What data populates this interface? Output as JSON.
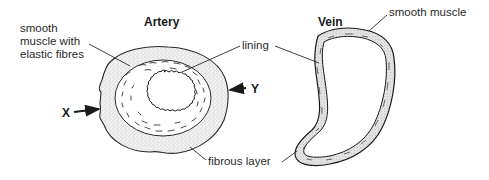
{
  "figure": {
    "artery": {
      "title": "Artery",
      "labels": {
        "smooth_muscle_line1": "smooth",
        "smooth_muscle_line2": "muscle with",
        "smooth_muscle_line3": "elastic fibres",
        "marker_x": "X",
        "marker_y": "Y"
      }
    },
    "vein": {
      "title": "Vein",
      "labels": {
        "smooth_muscle": "smooth muscle"
      }
    },
    "shared_labels": {
      "lining": "lining",
      "fibrous_layer": "fibrous layer"
    },
    "colors": {
      "line": "#2a2a2a",
      "stipple": "#9a9a9a",
      "background": "#ffffff"
    }
  }
}
